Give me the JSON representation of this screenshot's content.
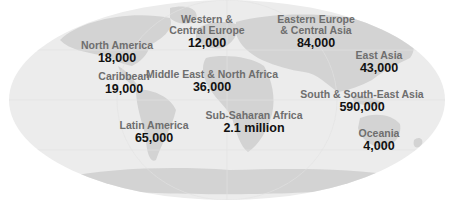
{
  "map": {
    "type": "choropleth-labels",
    "projection": "world-oval",
    "colors": {
      "ocean": "#ececec",
      "land": "#d2d2d2",
      "region_label": "#6e6e6e",
      "value_label": "#111111"
    }
  },
  "regions": [
    {
      "name": "North America",
      "value": "18,000",
      "x": 117,
      "y": 40
    },
    {
      "name": "Caribbean",
      "value": "19,000",
      "x": 124,
      "y": 71
    },
    {
      "name": "Western & Central Europe",
      "name_lines": [
        "Western &",
        "Central Europe"
      ],
      "value": "12,000",
      "x": 207,
      "y": 14
    },
    {
      "name": "Eastern Europe & Central Asia",
      "name_lines": [
        "Eastern Europe",
        "& Central Asia"
      ],
      "value": "84,000",
      "x": 316,
      "y": 14
    },
    {
      "name": "East Asia",
      "value": "43,000",
      "x": 379,
      "y": 50
    },
    {
      "name": "Middle East & North Africa",
      "value": "36,000",
      "x": 212,
      "y": 69
    },
    {
      "name": "South & South-East Asia",
      "value": "590,000",
      "x": 362,
      "y": 89
    },
    {
      "name": "Sub-Saharan Africa",
      "value": "2.1 million",
      "x": 254,
      "y": 110
    },
    {
      "name": "Latin America",
      "value": "65,000",
      "x": 154,
      "y": 120
    },
    {
      "name": "Oceania",
      "value": "4,000",
      "x": 379,
      "y": 128
    }
  ]
}
